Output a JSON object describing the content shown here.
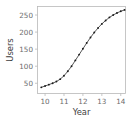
{
  "chart_data": {
    "type": "scatter",
    "title": "",
    "subtitle": "",
    "xlabel": "Year",
    "ylabel": "Users",
    "xlim": [
      9.6,
      14.25
    ],
    "ylim": [
      20,
      275
    ],
    "xticks": [
      10,
      11,
      12,
      13,
      14
    ],
    "xticklabels": [
      "10",
      "11",
      "12",
      "13",
      "14"
    ],
    "yticks": [
      50,
      100,
      150,
      200,
      250
    ],
    "yticklabels": [
      "50",
      "100",
      "150",
      "200",
      "250"
    ],
    "grid": false,
    "legend": false,
    "legend_position": "none",
    "marker": "filled-circle",
    "line_style": "solid",
    "series": [
      {
        "name": "Users",
        "x": [
          9.8,
          10.0,
          10.2,
          10.4,
          10.6,
          10.8,
          11.0,
          11.2,
          11.4,
          11.6,
          11.8,
          12.0,
          12.2,
          12.4,
          12.6,
          12.8,
          13.0,
          13.2,
          13.4,
          13.6,
          13.8,
          14.0,
          14.2
        ],
        "values": [
          38,
          42,
          46,
          50,
          55,
          62,
          72,
          85,
          100,
          117,
          134,
          151,
          168,
          184,
          199,
          212,
          224,
          234,
          243,
          250,
          256,
          261,
          265
        ]
      }
    ]
  },
  "colors": {
    "background": "#ffffff",
    "line": "#3a3a3a",
    "marker": "#1c1c1c",
    "axis": "#b9b9b9",
    "tick_label": "#6b6b6b",
    "axis_title": "#3d3d3d"
  }
}
